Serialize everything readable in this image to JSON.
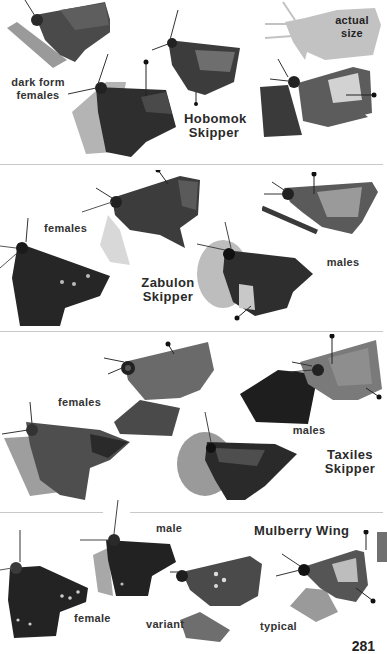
{
  "page": {
    "page_number": "281",
    "side_tab_color": "#707070",
    "divider_color": "#c8c8c8"
  },
  "sections": [
    {
      "species": "Hobomok Skipper",
      "title_line1": "Hobomok",
      "title_line2": "Skipper",
      "labels": {
        "dark_form_line1": "dark form",
        "dark_form_line2": "females",
        "actual_size_line1": "actual",
        "actual_size_line2": "size"
      }
    },
    {
      "species": "Zabulon Skipper",
      "title_line1": "Zabulon",
      "title_line2": "Skipper",
      "labels": {
        "females": "females",
        "males": "males"
      }
    },
    {
      "species": "Taxiles Skipper",
      "title_line1": "Taxiles",
      "title_line2": "Skipper",
      "labels": {
        "females": "females",
        "males": "males"
      }
    },
    {
      "species": "Mulberry Wing",
      "title": "Mulberry Wing",
      "labels": {
        "male": "male",
        "female": "female",
        "variant": "variant",
        "typical": "typical"
      }
    }
  ],
  "icons": {
    "butterfly": "skipper-butterfly-photo",
    "silhouette": "actual-size-silhouette"
  }
}
